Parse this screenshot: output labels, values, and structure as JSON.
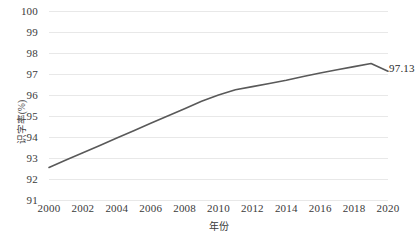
{
  "chart_data": {
    "type": "line",
    "title": "",
    "xlabel": "年份",
    "ylabel": "识字率(%)",
    "xlim": [
      2000,
      2020
    ],
    "ylim": [
      91,
      100
    ],
    "ytick_step": 1,
    "xtick_step": 2,
    "grid": "horizontal",
    "legend": "none",
    "line_color": "#595959",
    "x": [
      2000,
      2001,
      2002,
      2003,
      2004,
      2005,
      2006,
      2007,
      2008,
      2009,
      2010,
      2011,
      2012,
      2013,
      2014,
      2015,
      2016,
      2017,
      2018,
      2019,
      2020
    ],
    "values": [
      92.55,
      92.9,
      93.25,
      93.6,
      93.95,
      94.3,
      94.65,
      95.0,
      95.35,
      95.7,
      96.0,
      96.25,
      96.4,
      96.55,
      96.7,
      96.88,
      97.05,
      97.2,
      97.35,
      97.5,
      97.13
    ],
    "ytick_labels": [
      "100",
      "99",
      "98",
      "97",
      "96",
      "95",
      "94",
      "93",
      "92",
      "91"
    ],
    "ytick_values": [
      100,
      99,
      98,
      97,
      96,
      95,
      94,
      93,
      92,
      91
    ],
    "xtick_labels": [
      "2000",
      "2002",
      "2004",
      "2006",
      "2008",
      "2010",
      "2012",
      "2014",
      "2016",
      "2018",
      "2020"
    ],
    "xtick_values": [
      2000,
      2002,
      2004,
      2006,
      2008,
      2010,
      2012,
      2014,
      2016,
      2018,
      2020
    ],
    "annotations": [
      {
        "text": "97.13",
        "x": 2020,
        "y": 97.13
      }
    ]
  }
}
